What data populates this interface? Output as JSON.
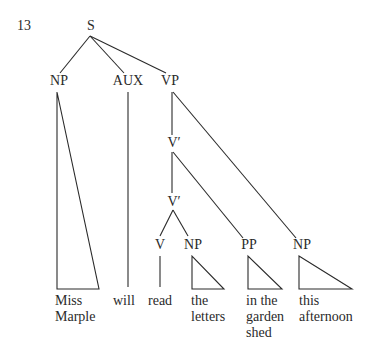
{
  "example_number": "13",
  "nodes": {
    "S": "S",
    "NP_subject": "NP",
    "AUX": "AUX",
    "VP": "VP",
    "Vbar_upper": "V′",
    "Vbar_lower": "V′",
    "V": "V",
    "NP_object": "NP",
    "PP": "PP",
    "NP_adjunct": "NP"
  },
  "leaves": {
    "miss_marple": [
      "Miss",
      "Marple"
    ],
    "will": "will",
    "read": "read",
    "the_letters": [
      "the",
      "letters"
    ],
    "in_the_garden_shed": [
      "in the",
      "garden",
      "shed"
    ],
    "this_afternoon": [
      "this",
      "afternoon"
    ]
  },
  "colors": {
    "line": "#2a2a2a",
    "text": "#2a2a2a",
    "background": "#ffffff"
  }
}
